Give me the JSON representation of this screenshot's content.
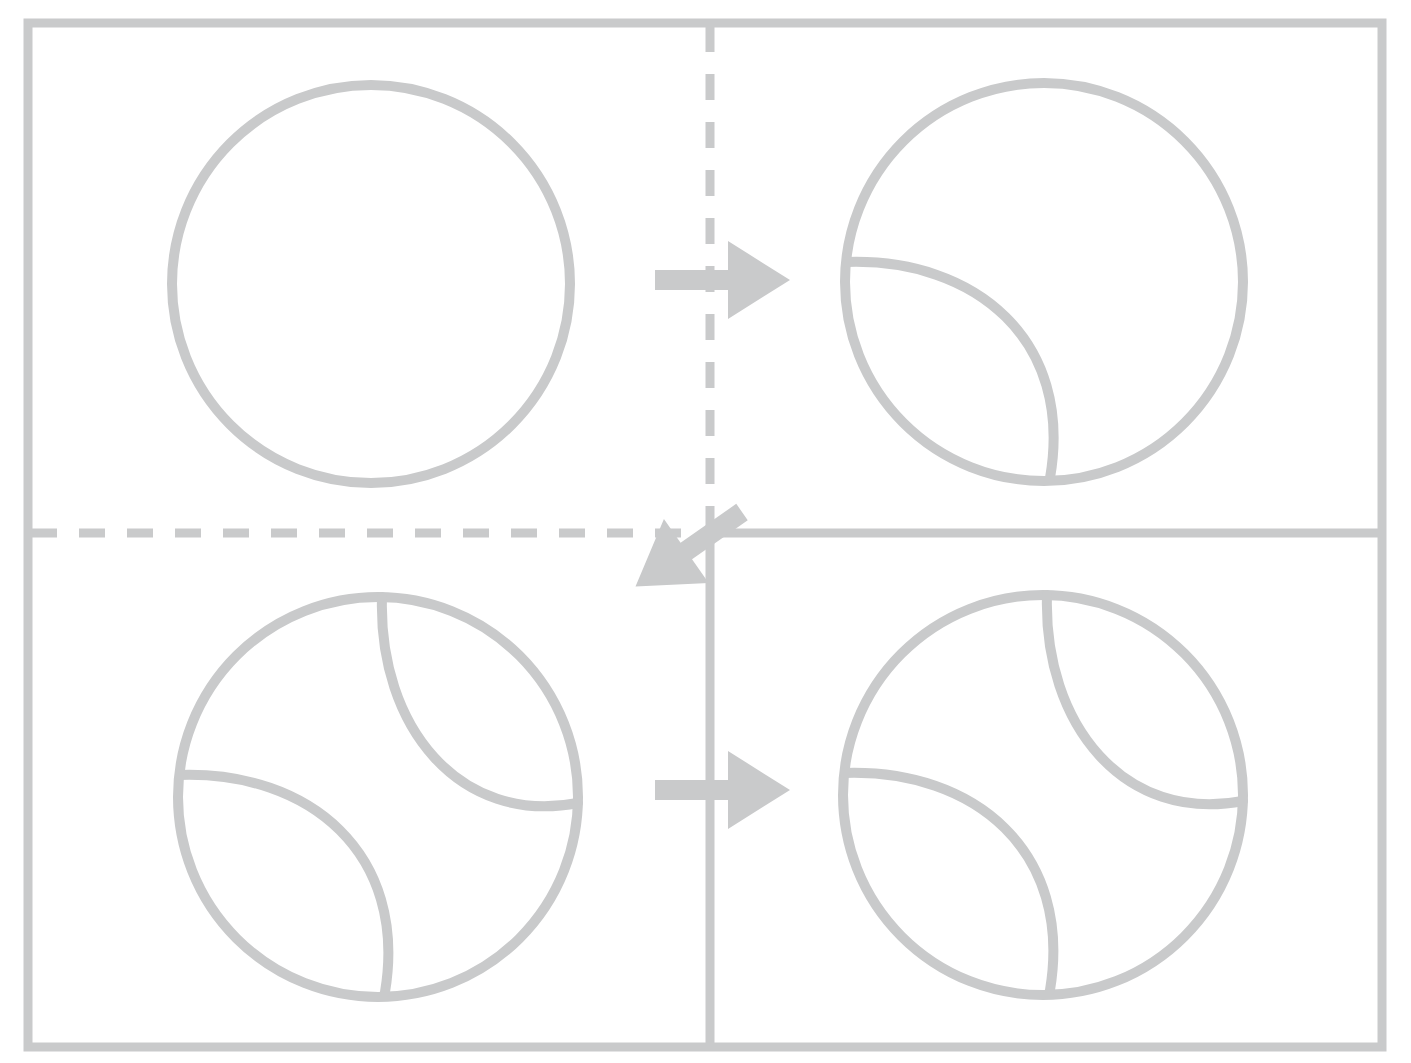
{
  "canvas": {
    "width": 1411,
    "height": 1063,
    "background": "#ffffff",
    "title": "Tennis ball drawing tutorial - four step storyboard"
  },
  "style": {
    "ink": "#c9cacb",
    "ink_light": "#d2d3d4",
    "stroke_width_frame": 9,
    "stroke_width_circle": 10,
    "stroke_width_divider": 9,
    "dash_pattern": "26 22"
  },
  "frame": {
    "label": "Outer panel border",
    "x": 28,
    "y": 23,
    "width": 1354,
    "height": 1024
  },
  "dividers": [
    {
      "name": "vertical-divider-top",
      "style": "dashed",
      "x1": 710,
      "y1": 26,
      "x2": 710,
      "y2": 533
    },
    {
      "name": "vertical-divider-bottom",
      "style": "solid",
      "x1": 710,
      "y1": 533,
      "x2": 710,
      "y2": 1044
    },
    {
      "name": "horizontal-divider-left",
      "style": "dashed",
      "x1": 31,
      "y1": 533,
      "x2": 710,
      "y2": 533
    },
    {
      "name": "horizontal-divider-right",
      "style": "solid",
      "x1": 710,
      "y1": 533,
      "x2": 1379,
      "y2": 533
    }
  ],
  "arrows": [
    {
      "name": "arrow-step1-to-step2",
      "direction": "right",
      "label": "Step 1 to Step 2",
      "x": 655,
      "y": 280,
      "length": 135,
      "rotation": 0
    },
    {
      "name": "arrow-step2-to-step3",
      "direction": "down-left",
      "label": "Step 2 to Step 3",
      "x": 742,
      "y": 512,
      "length": 130,
      "rotation": 145
    },
    {
      "name": "arrow-step3-to-step4",
      "direction": "right",
      "label": "Step 3 to Step 4",
      "x": 655,
      "y": 790,
      "length": 135,
      "rotation": 0
    }
  ],
  "panels": [
    {
      "name": "panel-step-1",
      "step": 1,
      "quadrant": "top-left",
      "caption": "Outline circle only",
      "circle": {
        "cx": 371,
        "cy": 284,
        "r": 199
      },
      "seams": []
    },
    {
      "name": "panel-step-2",
      "step": 2,
      "quadrant": "top-right",
      "caption": "Circle with first seam arc",
      "circle": {
        "cx": 1044,
        "cy": 282,
        "r": 199
      },
      "seams": [
        {
          "name": "seam-lower-left",
          "d": "M 847 262 C 975 258 1074 340 1050 478"
        }
      ]
    },
    {
      "name": "panel-step-3",
      "step": 3,
      "quadrant": "bottom-left",
      "caption": "Circle with both seam arcs",
      "circle": {
        "cx": 378,
        "cy": 797,
        "r": 200
      },
      "seams": [
        {
          "name": "seam-lower-left",
          "d": "M 180 775 C 310 771 408 854 385 992"
        },
        {
          "name": "seam-upper-right",
          "d": "M 382 597 C 378 727 460 826 578 803"
        }
      ]
    },
    {
      "name": "panel-step-4",
      "step": 4,
      "quadrant": "bottom-right",
      "caption": "Finished tennis ball",
      "circle": {
        "cx": 1043,
        "cy": 795,
        "r": 200
      },
      "seams": [
        {
          "name": "seam-lower-left",
          "d": "M 845 773 C 975 769 1073 852 1050 990"
        },
        {
          "name": "seam-upper-right",
          "d": "M 1047 595 C 1043 725 1125 824 1243 801"
        }
      ]
    }
  ]
}
